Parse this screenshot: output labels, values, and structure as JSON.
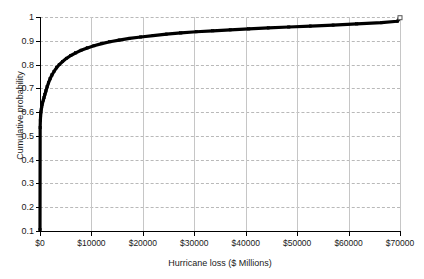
{
  "chart_data": {
    "type": "line",
    "title": "",
    "subtitle": "",
    "xlabel": "Hurricane loss ($ Millions)",
    "ylabel": "Cumulative probability",
    "xlim": [
      0,
      70000
    ],
    "ylim": [
      0.1,
      1.0
    ],
    "grid": true,
    "legend": null,
    "legend_position": "none",
    "x_ticks": [
      0,
      10000,
      20000,
      30000,
      40000,
      50000,
      60000,
      70000
    ],
    "x_tick_labels": [
      "$0",
      "$10000",
      "$20000",
      "$30000",
      "$40000",
      "$50000",
      "$60000",
      "$70000"
    ],
    "y_ticks": [
      0.1,
      0.2,
      0.3,
      0.4,
      0.5,
      0.6,
      0.7,
      0.8,
      0.9,
      1
    ],
    "y_tick_labels": [
      "0.1",
      "0.2",
      "0.3",
      "0.4",
      "0.5",
      "0.6",
      "0.7",
      "0.8",
      "0.9",
      "1"
    ],
    "series": [
      {
        "name": "Hurricane loss CDF",
        "color": "#000000",
        "marker": "square",
        "x": [
          0,
          30,
          70,
          120,
          180,
          250,
          330,
          420,
          520,
          640,
          780,
          950,
          1150,
          1380,
          1650,
          1960,
          2320,
          2730,
          3200,
          3750,
          4400,
          5150,
          6000,
          6950,
          8000,
          9200,
          10500,
          12000,
          13600,
          15400,
          17400,
          19600,
          22000,
          24600,
          27400,
          30400,
          33600,
          37000,
          40600,
          44400,
          48400,
          52600,
          57000,
          61600,
          66400,
          69500,
          70000
        ],
        "y": [
          0.105,
          0.535,
          0.565,
          0.585,
          0.6,
          0.612,
          0.622,
          0.632,
          0.641,
          0.65,
          0.661,
          0.674,
          0.689,
          0.706,
          0.723,
          0.74,
          0.756,
          0.771,
          0.786,
          0.8,
          0.813,
          0.826,
          0.838,
          0.849,
          0.86,
          0.87,
          0.879,
          0.888,
          0.896,
          0.903,
          0.91,
          0.916,
          0.922,
          0.928,
          0.933,
          0.938,
          0.942,
          0.946,
          0.95,
          0.954,
          0.958,
          0.962,
          0.966,
          0.971,
          0.976,
          0.982,
          0.997
        ]
      }
    ]
  },
  "axes": {
    "x_title": "Hurricane loss ($ Millions)",
    "y_title": "Cumulative probability"
  }
}
